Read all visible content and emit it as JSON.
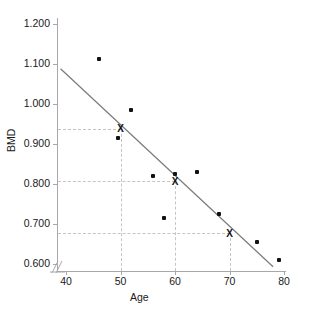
{
  "chart_data": {
    "type": "scatter",
    "title": "",
    "xlabel": "Age",
    "ylabel": "BMD",
    "xlim": [
      39,
      81
    ],
    "ylim": [
      0.58,
      1.23
    ],
    "grid": false,
    "legend": null,
    "x_ticks": [
      40,
      50,
      60,
      70,
      80
    ],
    "x_tick_labels": [
      "40",
      "50",
      "60",
      "70",
      "80"
    ],
    "y_ticks": [
      0.6,
      0.7,
      0.8,
      0.9,
      1.0,
      1.1,
      1.2
    ],
    "y_tick_labels": [
      "0.600",
      "0.700",
      "0.800",
      "0.900",
      "1.000",
      "1.100",
      "1.200"
    ],
    "axis_break_on_x": true,
    "points": [
      {
        "x": 46.0,
        "y": 1.112
      },
      {
        "x": 49.5,
        "y": 0.916
      },
      {
        "x": 52.0,
        "y": 0.986
      },
      {
        "x": 56.0,
        "y": 0.82
      },
      {
        "x": 58.0,
        "y": 0.714
      },
      {
        "x": 60.0,
        "y": 0.824
      },
      {
        "x": 64.0,
        "y": 0.831
      },
      {
        "x": 68.0,
        "y": 0.724
      },
      {
        "x": 75.0,
        "y": 0.655
      },
      {
        "x": 79.0,
        "y": 0.61
      }
    ],
    "marked_points": [
      {
        "x": 50,
        "y": 0.938,
        "label": "X"
      },
      {
        "x": 60,
        "y": 0.807,
        "label": "X"
      },
      {
        "x": 70,
        "y": 0.677,
        "label": "X"
      }
    ],
    "fit_line": {
      "x_start": 39.0,
      "y_start": 1.088,
      "x_end": 78.0,
      "y_end": 0.593,
      "color": "#7a7a7a"
    },
    "guide_lines": {
      "color": "#c4c4c4",
      "style": "dashed",
      "y_values": [
        0.938,
        0.807,
        0.677
      ],
      "x_values": [
        50,
        60,
        70
      ]
    }
  },
  "colors": {
    "axis": "#a8a8a8",
    "point": "#121212",
    "fit": "#7a7a7a",
    "guide": "#c4c4c4",
    "text": "#1a1a1a",
    "background": "#ffffff"
  }
}
